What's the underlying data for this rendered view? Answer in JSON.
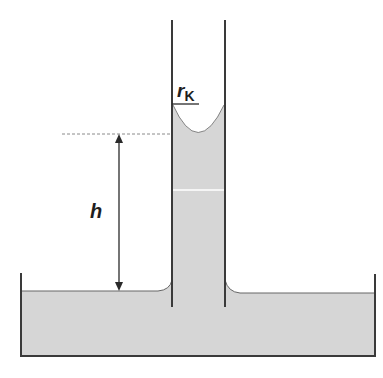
{
  "diagram": {
    "labels": {
      "height": "h",
      "radius_main": "r",
      "radius_sub": "K"
    },
    "colors": {
      "liquid": "#d6d6d6",
      "wall": "#3a3a3a",
      "arrow": "#2a2a2a",
      "dashed": "#8a8a8a"
    }
  }
}
